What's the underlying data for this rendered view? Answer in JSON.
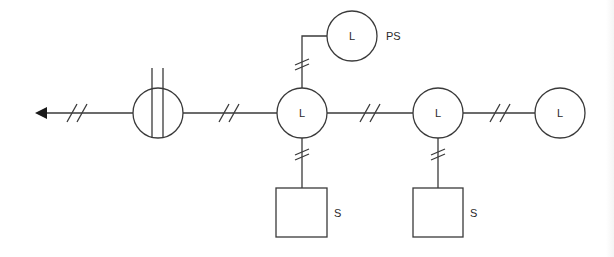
{
  "diagram": {
    "type": "network schematic",
    "colors": {
      "stroke": "#3a3a3a",
      "background": "#ffffff",
      "text": "#2a2a2a"
    },
    "nodes": [
      {
        "id": "meter",
        "shape": "circle-with-two-vertical-lines",
        "label": ""
      },
      {
        "id": "l1",
        "shape": "circle",
        "label": "L"
      },
      {
        "id": "ps",
        "shape": "circle",
        "label": "L",
        "side_label": "PS"
      },
      {
        "id": "l2",
        "shape": "circle",
        "label": "L"
      },
      {
        "id": "l3",
        "shape": "circle",
        "label": "L"
      },
      {
        "id": "s1",
        "shape": "square",
        "label": "",
        "side_label": "S"
      },
      {
        "id": "s2",
        "shape": "square",
        "label": "",
        "side_label": "S"
      }
    ],
    "edges": [
      {
        "from": "meter",
        "to": "arrow-out-left",
        "marker": "//"
      },
      {
        "from": "meter",
        "to": "l1",
        "marker": "//"
      },
      {
        "from": "l1",
        "to": "ps",
        "marker": "//"
      },
      {
        "from": "l1",
        "to": "l2",
        "marker": "//"
      },
      {
        "from": "l2",
        "to": "l3",
        "marker": "//"
      },
      {
        "from": "l1",
        "to": "s1",
        "marker": "//"
      },
      {
        "from": "l2",
        "to": "s2",
        "marker": "//"
      }
    ],
    "labels": {
      "l1": "L",
      "ps_inner": "L",
      "ps_side": "PS",
      "l2": "L",
      "l3": "L",
      "s1_side": "S",
      "s2_side": "S"
    }
  }
}
